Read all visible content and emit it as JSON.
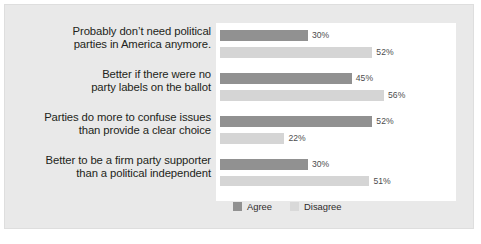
{
  "chart_data": {
    "type": "bar",
    "title": "",
    "subtitle": "",
    "xlabel": "",
    "ylabel": "",
    "orientation": "horizontal",
    "grid": false,
    "legend_position": "bottom",
    "xlim": [
      0,
      60
    ],
    "categories": [
      "Probably don't need political parties in America anymore.",
      "Better if there were no party labels on the ballot",
      "Parties do more to confuse issues than provide a clear choice",
      "Better to be a firm party supporter than a political independent"
    ],
    "category_lines": [
      [
        "Probably don’t need political",
        "parties in America anymore."
      ],
      [
        "Better if there were no",
        "party labels on the ballot"
      ],
      [
        "Parties do more to confuse issues",
        "than provide a clear choice"
      ],
      [
        "Better to be a firm party supporter",
        "than a political independent"
      ]
    ],
    "series": [
      {
        "name": "Agree",
        "color": "#919191",
        "values": [
          30,
          45,
          52,
          30
        ],
        "labels": [
          "30%",
          "45%",
          "52%",
          "30%"
        ]
      },
      {
        "name": "Disagree",
        "color": "#d5d5d5",
        "values": [
          52,
          56,
          22,
          51
        ],
        "labels": [
          "52%",
          "56%",
          "22%",
          "51%"
        ]
      }
    ]
  },
  "legend": {
    "items": [
      {
        "label": "Agree",
        "color": "#919191"
      },
      {
        "label": "Disagree",
        "color": "#d9d9d9"
      }
    ]
  },
  "colors": {
    "figure_background": "#e9e9e9",
    "plot_background": "#ffffff",
    "agree": "#919191",
    "disagree": "#d5d5d5",
    "label_text": "#231f20",
    "value_text": "#4d4d4d"
  }
}
